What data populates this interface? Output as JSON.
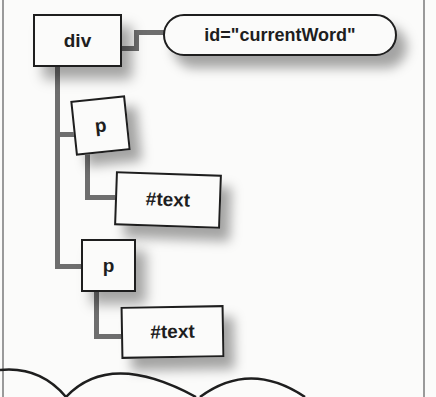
{
  "diagram": {
    "type": "DOM tree",
    "root": {
      "label": "div",
      "attribute": "id=\"currentWord\"",
      "children": [
        {
          "label": "p",
          "children": [
            {
              "label": "#text"
            }
          ]
        },
        {
          "label": "p",
          "children": [
            {
              "label": "#text"
            }
          ]
        }
      ]
    }
  },
  "nodes": {
    "div": "div",
    "attr": "id=\"currentWord\"",
    "p1": "p",
    "text1": "#text",
    "p2": "p",
    "text2": "#text"
  },
  "colors": {
    "background": "#fbfbfa",
    "outline": "#1e1e1e",
    "connector": "#6e6e6e",
    "frame": "#9a9a9a"
  }
}
